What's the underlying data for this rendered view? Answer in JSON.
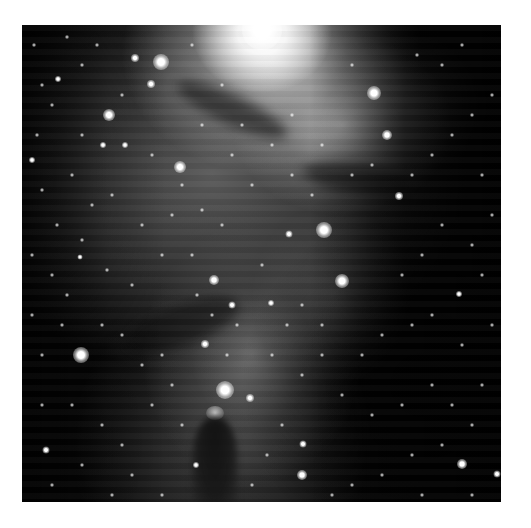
{
  "image": {
    "subject": "Cone Nebula star-forming region (grayscale astronomical image)",
    "frame": {
      "left": 22,
      "top": 25,
      "width": 479,
      "height": 477,
      "border_color": "#ffffff"
    },
    "colors": {
      "background": "#ffffff",
      "sky": "#050505",
      "nebula": "#9a9a9a",
      "star": "#ffffff"
    }
  },
  "bright_stars": [
    {
      "x": 240,
      "y": 5,
      "r": 40
    },
    {
      "x": 139,
      "y": 37,
      "r": 16
    },
    {
      "x": 113,
      "y": 33,
      "r": 8
    },
    {
      "x": 129,
      "y": 59,
      "r": 8
    },
    {
      "x": 87,
      "y": 90,
      "r": 12
    },
    {
      "x": 158,
      "y": 142,
      "r": 12
    },
    {
      "x": 81,
      "y": 120,
      "r": 6
    },
    {
      "x": 103,
      "y": 120,
      "r": 6
    },
    {
      "x": 36,
      "y": 54,
      "r": 6
    },
    {
      "x": 352,
      "y": 68,
      "r": 14
    },
    {
      "x": 365,
      "y": 110,
      "r": 10
    },
    {
      "x": 302,
      "y": 205,
      "r": 16
    },
    {
      "x": 377,
      "y": 171,
      "r": 8
    },
    {
      "x": 267,
      "y": 209,
      "r": 7
    },
    {
      "x": 59,
      "y": 330,
      "r": 16
    },
    {
      "x": 203,
      "y": 365,
      "r": 18
    },
    {
      "x": 192,
      "y": 255,
      "r": 10
    },
    {
      "x": 183,
      "y": 319,
      "r": 8
    },
    {
      "x": 228,
      "y": 373,
      "r": 8
    },
    {
      "x": 320,
      "y": 256,
      "r": 14
    },
    {
      "x": 440,
      "y": 439,
      "r": 10
    },
    {
      "x": 280,
      "y": 450,
      "r": 10
    },
    {
      "x": 281,
      "y": 419,
      "r": 7
    },
    {
      "x": 437,
      "y": 269,
      "r": 6
    },
    {
      "x": 475,
      "y": 449,
      "r": 7
    },
    {
      "x": 24,
      "y": 425,
      "r": 7
    },
    {
      "x": 249,
      "y": 278,
      "r": 6
    },
    {
      "x": 174,
      "y": 440,
      "r": 6
    },
    {
      "x": 210,
      "y": 280,
      "r": 7
    },
    {
      "x": 58,
      "y": 232,
      "r": 5
    },
    {
      "x": 10,
      "y": 135,
      "r": 6
    }
  ],
  "faint_stars": [
    [
      12,
      20
    ],
    [
      45,
      12
    ],
    [
      60,
      40
    ],
    [
      30,
      80
    ],
    [
      15,
      110
    ],
    [
      50,
      150
    ],
    [
      20,
      165
    ],
    [
      70,
      180
    ],
    [
      35,
      200
    ],
    [
      10,
      230
    ],
    [
      90,
      170
    ],
    [
      120,
      200
    ],
    [
      150,
      190
    ],
    [
      180,
      185
    ],
    [
      200,
      200
    ],
    [
      60,
      215
    ],
    [
      30,
      250
    ],
    [
      10,
      290
    ],
    [
      45,
      270
    ],
    [
      85,
      245
    ],
    [
      110,
      260
    ],
    [
      140,
      230
    ],
    [
      170,
      230
    ],
    [
      230,
      160
    ],
    [
      210,
      130
    ],
    [
      250,
      120
    ],
    [
      270,
      150
    ],
    [
      290,
      170
    ],
    [
      330,
      150
    ],
    [
      350,
      140
    ],
    [
      390,
      150
    ],
    [
      410,
      130
    ],
    [
      430,
      110
    ],
    [
      450,
      90
    ],
    [
      470,
      70
    ],
    [
      420,
      40
    ],
    [
      440,
      20
    ],
    [
      395,
      30
    ],
    [
      460,
      150
    ],
    [
      470,
      190
    ],
    [
      450,
      220
    ],
    [
      420,
      200
    ],
    [
      400,
      230
    ],
    [
      380,
      250
    ],
    [
      460,
      250
    ],
    [
      470,
      300
    ],
    [
      440,
      320
    ],
    [
      410,
      290
    ],
    [
      390,
      300
    ],
    [
      360,
      310
    ],
    [
      340,
      330
    ],
    [
      300,
      330
    ],
    [
      280,
      350
    ],
    [
      320,
      370
    ],
    [
      350,
      390
    ],
    [
      380,
      380
    ],
    [
      410,
      360
    ],
    [
      430,
      380
    ],
    [
      460,
      360
    ],
    [
      450,
      400
    ],
    [
      420,
      420
    ],
    [
      390,
      430
    ],
    [
      360,
      450
    ],
    [
      330,
      460
    ],
    [
      310,
      470
    ],
    [
      400,
      470
    ],
    [
      450,
      470
    ],
    [
      40,
      300
    ],
    [
      20,
      330
    ],
    [
      80,
      300
    ],
    [
      100,
      310
    ],
    [
      120,
      340
    ],
    [
      140,
      330
    ],
    [
      20,
      380
    ],
    [
      50,
      380
    ],
    [
      80,
      400
    ],
    [
      100,
      420
    ],
    [
      60,
      440
    ],
    [
      30,
      460
    ],
    [
      110,
      450
    ],
    [
      140,
      470
    ],
    [
      90,
      470
    ],
    [
      160,
      400
    ],
    [
      150,
      360
    ],
    [
      130,
      380
    ],
    [
      250,
      330
    ],
    [
      260,
      400
    ],
    [
      245,
      430
    ],
    [
      230,
      460
    ],
    [
      265,
      300
    ],
    [
      240,
      240
    ],
    [
      280,
      280
    ],
    [
      300,
      300
    ],
    [
      180,
      100
    ],
    [
      200,
      60
    ],
    [
      60,
      110
    ],
    [
      100,
      70
    ],
    [
      170,
      20
    ],
    [
      20,
      60
    ],
    [
      75,
      20
    ],
    [
      330,
      40
    ],
    [
      300,
      120
    ],
    [
      270,
      90
    ],
    [
      220,
      100
    ],
    [
      130,
      130
    ],
    [
      160,
      160
    ],
    [
      190,
      290
    ],
    [
      175,
      270
    ],
    [
      215,
      300
    ],
    [
      205,
      330
    ]
  ]
}
